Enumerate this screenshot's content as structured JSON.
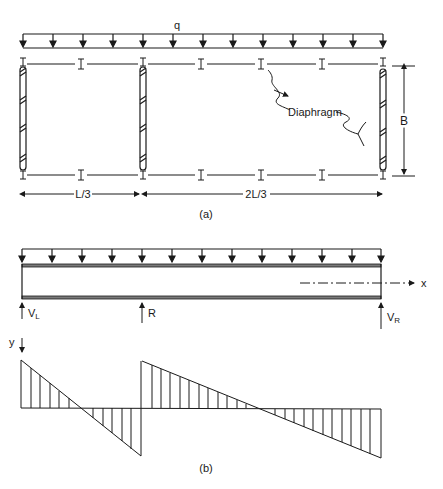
{
  "figure": {
    "part_a": {
      "load_label": "q",
      "diaphragm_label": "Diaphragm",
      "width_label": "B",
      "span_left_label": "L/3",
      "span_right_label": "2L/3",
      "caption": "(a)"
    },
    "part_b": {
      "axis_x_label": "x",
      "axis_y_label": "y",
      "support_left": {
        "main": "V",
        "sub": "L"
      },
      "support_middle": "R",
      "support_right": {
        "main": "V",
        "sub": "R"
      },
      "caption": "(b)"
    },
    "colors": {
      "ink": "#1a1a1a",
      "background": "#ffffff"
    }
  }
}
